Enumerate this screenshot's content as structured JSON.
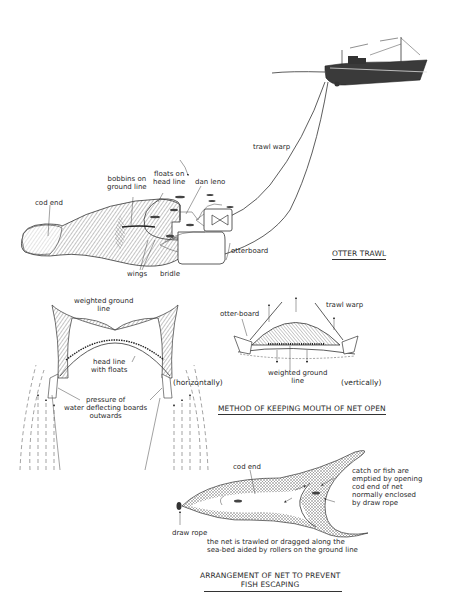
{
  "otter_trawl": {
    "title": "OTTER TRAWL",
    "labels": {
      "trawl_warp": "trawl warp",
      "cod_end": "cod end",
      "bobbins_1": "bobbins on",
      "bobbins_2": "ground line",
      "floats_1": "floats on",
      "floats_2": "head line",
      "dan_leno": "dan leno",
      "otterboard": "otterboard",
      "wings": "wings",
      "bridle": "bridle"
    }
  },
  "mouth_open": {
    "title": "METHOD OF KEEPING MOUTH OF NET OPEN",
    "horizontal": {
      "caption": "(horizontally)",
      "weighted_1": "weighted ground",
      "weighted_2": "line",
      "headline_1": "head line",
      "headline_2": "with floats",
      "pressure_1": "pressure of",
      "pressure_2": "water deflecting boards",
      "pressure_3": "outwards"
    },
    "vertical": {
      "caption": "(vertically)",
      "otter_board": "otter-board",
      "trawl_warp": "trawl warp",
      "weighted_1": "weighted ground",
      "weighted_2": "line"
    }
  },
  "escape": {
    "title_1": "ARRANGEMENT OF NET TO PREVENT",
    "title_2": "FISH ESCAPING",
    "cod_end": "cod end",
    "draw_rope": "draw rope",
    "catch_1": "catch or fish are",
    "catch_2": "emptied by opening",
    "catch_3": "cod end of net",
    "catch_4": "normally enclosed",
    "catch_5": "by draw rope",
    "trawled_1": "the net is trawled or dragged along the",
    "trawled_2": "sea-bed aided by rollers on the ground line"
  }
}
